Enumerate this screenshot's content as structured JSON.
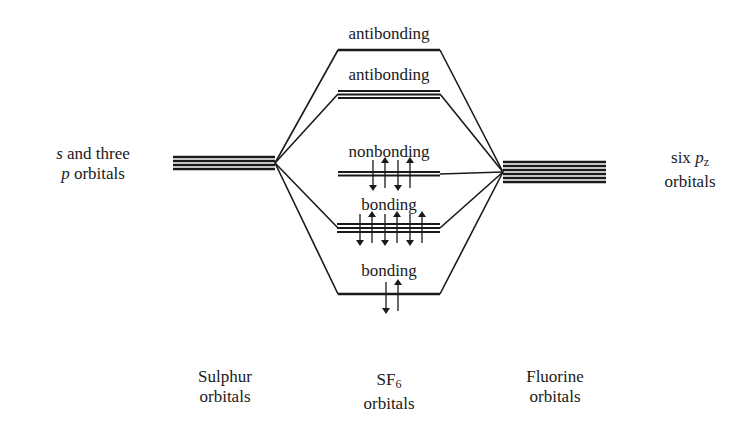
{
  "diagram": {
    "left_group": {
      "label_line1_italic": "s",
      "label_line1_rest": " and three",
      "label_line2_italic": "p",
      "label_line2_rest": " orbitals",
      "bottom_label_line1": "Sulphur",
      "bottom_label_line2": "orbitals",
      "orbital_count": 4
    },
    "right_group": {
      "label_line1_pre": "six ",
      "label_line1_italic": "p",
      "label_line1_sub": "z",
      "label_line2": "orbitals",
      "bottom_label_line1": "Fluorine",
      "bottom_label_line2": "orbitals",
      "orbital_count": 6
    },
    "center_group": {
      "bottom_label_line1_main": "SF",
      "bottom_label_line1_sub": "6",
      "bottom_label_line2": "orbitals"
    },
    "levels": [
      {
        "label": "antibonding",
        "degeneracy": 1,
        "electrons": 0
      },
      {
        "label": "antibonding",
        "degeneracy": 3,
        "electrons": 0
      },
      {
        "label": "nonbonding",
        "degeneracy": 2,
        "electrons": 4
      },
      {
        "label": "bonding",
        "degeneracy": 3,
        "electrons": 6
      },
      {
        "label": "bonding",
        "degeneracy": 1,
        "electrons": 2
      }
    ],
    "line_color": "#1a1a1a"
  }
}
